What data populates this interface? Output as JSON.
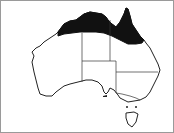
{
  "map": {
    "subject": "Australia distribution map",
    "shaded_region": "northern Australia (Kimberley, Top End, Gulf country, Cape York)",
    "colors": {
      "land": "#ffffff",
      "outline": "#222222",
      "shading": "#111111",
      "border": "#9a9a9a"
    },
    "states": [
      "WA",
      "NT",
      "SA",
      "QLD",
      "NSW",
      "VIC",
      "TAS"
    ]
  }
}
